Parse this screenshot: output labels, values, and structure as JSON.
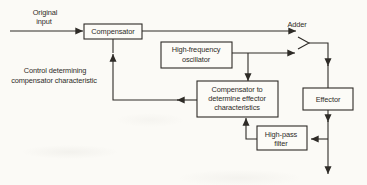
{
  "figure": {
    "colors": {
      "background": "#fbfaf6",
      "ink": "#2e2b27",
      "box_fill": "#fcfbf7"
    },
    "nodes": {
      "compensator": {
        "label": "Compensator"
      },
      "hf_oscillator": {
        "line1": "High-frequency",
        "line2": "oscillator"
      },
      "comp_effector": {
        "line1": "Compensator to",
        "line2": "determine effector",
        "line3": "characteristics"
      },
      "effector": {
        "label": "Effector"
      },
      "hp_filter": {
        "line1": "High-pass",
        "line2": "filter"
      }
    },
    "labels": {
      "original_input": {
        "line1": "Original",
        "line2": "input"
      },
      "adder": "Adder",
      "control": {
        "line1": "Control determining",
        "line2": "compensator characteristic"
      }
    }
  }
}
